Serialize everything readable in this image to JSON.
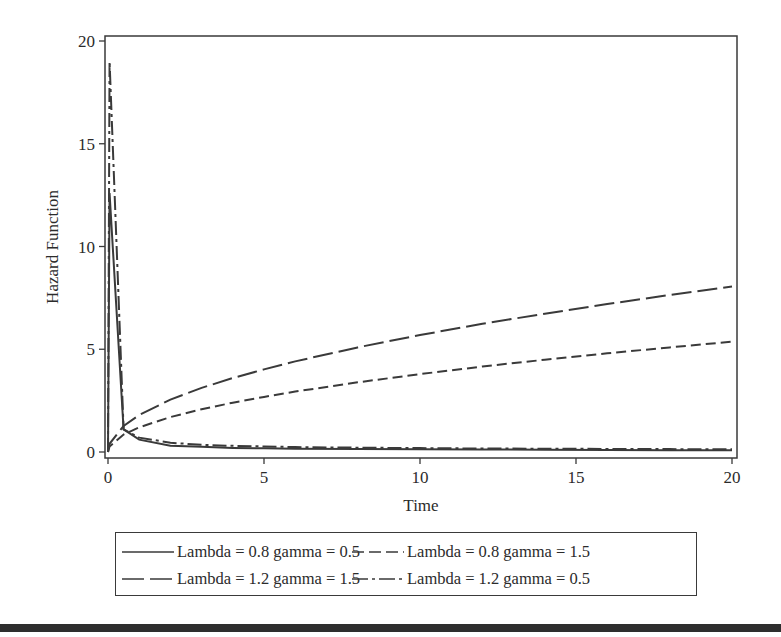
{
  "chart_data": {
    "type": "line",
    "title": "",
    "xlabel": "Time",
    "ylabel": "Hazard Function",
    "xlim": [
      0,
      20
    ],
    "ylim": [
      0,
      20
    ],
    "xticks": [
      0,
      5,
      10,
      15,
      20
    ],
    "yticks": [
      0,
      5,
      10,
      15,
      20
    ],
    "grid": false,
    "legend_position": "bottom",
    "x": [
      0.05,
      0.5,
      1,
      2,
      3,
      4,
      5,
      6,
      8,
      10,
      12,
      14,
      16,
      18,
      20
    ],
    "series": [
      {
        "name": "Lambda = 0.8 gamma = 0.5",
        "style": "solid",
        "values": [
          12.6,
          1.1,
          0.6,
          0.3,
          0.25,
          0.2,
          0.18,
          0.16,
          0.14,
          0.13,
          0.12,
          0.11,
          0.1,
          0.09,
          0.09
        ]
      },
      {
        "name": "Lambda = 0.8 gamma = 1.5",
        "style": "short-dash",
        "values": [
          0.27,
          0.85,
          1.2,
          1.7,
          2.08,
          2.4,
          2.68,
          2.94,
          3.39,
          3.79,
          4.16,
          4.49,
          4.8,
          5.09,
          5.37
        ]
      },
      {
        "name": "Lambda = 1.2 gamma = 1.5",
        "style": "long-dash",
        "values": [
          0.4,
          1.27,
          1.8,
          2.55,
          3.12,
          3.6,
          4.02,
          4.41,
          5.09,
          5.69,
          6.24,
          6.73,
          7.2,
          7.64,
          8.05
        ]
      },
      {
        "name": "Lambda = 1.2 gamma = 0.5",
        "style": "dash-dot",
        "values": [
          19.0,
          1.1,
          0.7,
          0.45,
          0.35,
          0.3,
          0.27,
          0.24,
          0.21,
          0.19,
          0.17,
          0.16,
          0.15,
          0.14,
          0.13
        ]
      }
    ]
  },
  "legend": {
    "items": [
      {
        "label": "Lambda = 0.8 gamma = 0.5"
      },
      {
        "label": "Lambda = 0.8 gamma = 1.5"
      },
      {
        "label": "Lambda = 1.2 gamma = 1.5"
      },
      {
        "label": "Lambda = 1.2 gamma = 0.5"
      }
    ]
  },
  "axes": {
    "x_label": "Time",
    "y_label": "Hazard Function",
    "x_ticks": [
      "0",
      "5",
      "10",
      "15",
      "20"
    ],
    "y_ticks": [
      "0",
      "5",
      "10",
      "15",
      "20"
    ]
  },
  "colors": {
    "line": "#3a3a3a",
    "frame": "#3a3a3a",
    "background": "#ffffff"
  }
}
